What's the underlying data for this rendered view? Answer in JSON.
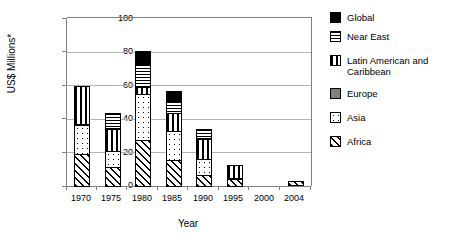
{
  "chart_data": {
    "type": "bar",
    "stacked": true,
    "title": "",
    "xlabel": "Year",
    "ylabel": "US$ Millions*",
    "categories": [
      "1970",
      "1975",
      "1980",
      "1985",
      "1990",
      "1995",
      "2000",
      "2004"
    ],
    "ylim": [
      0,
      100
    ],
    "yticks": [
      "0",
      "20",
      "40",
      "60",
      "80",
      "100"
    ],
    "grid": true,
    "legend_position": "right",
    "series": [
      {
        "name": "Africa",
        "pattern": "diagonal-hatch",
        "color": "#ffffff",
        "values": [
          19.5,
          12,
          28,
          16,
          7,
          5,
          0,
          3
        ]
      },
      {
        "name": "Asia",
        "pattern": "white-dotted",
        "color": "#ffffff",
        "values": [
          18,
          10,
          28,
          18,
          10,
          0,
          0,
          0
        ]
      },
      {
        "name": "Europe",
        "pattern": "solid-gray",
        "color": "#808080",
        "values": [
          0,
          0,
          0,
          0,
          0,
          0,
          0,
          0
        ]
      },
      {
        "name": "Latin American and Caribbean",
        "pattern": "vertical-lines",
        "color": "#ffffff",
        "values": [
          23,
          14,
          5,
          11,
          13,
          8,
          0,
          0
        ]
      },
      {
        "name": "Near East",
        "pattern": "horizontal-lines",
        "color": "#ffffff",
        "values": [
          0,
          9.5,
          14,
          8,
          5.5,
          0,
          0,
          0
        ]
      },
      {
        "name": "Global",
        "pattern": "solid-black",
        "color": "#000000",
        "values": [
          0,
          0,
          8,
          6,
          0,
          0,
          0,
          0
        ]
      }
    ],
    "totals": [
      60.5,
      45.5,
      83,
      59,
      35.5,
      13,
      0,
      3
    ]
  },
  "legend": {
    "entries": [
      {
        "label": "Global",
        "swatch": "global-swatch-icon"
      },
      {
        "label": "Near East",
        "swatch": "near-east-swatch-icon"
      },
      {
        "label": "Latin American and Caribbean",
        "swatch": "latin-american-swatch-icon"
      },
      {
        "label": "Europe",
        "swatch": "europe-swatch-icon"
      },
      {
        "label": "Asia",
        "swatch": "asia-swatch-icon"
      },
      {
        "label": "Africa",
        "swatch": "africa-swatch-icon"
      }
    ]
  }
}
